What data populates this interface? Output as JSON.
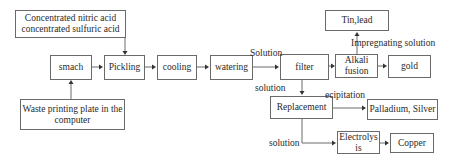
{
  "diagram": {
    "type": "process-flowchart",
    "nodes": {
      "acids": "Concentrated nitric acid\nconcentrated sulfuric acid",
      "acids_line1": "Concentrated nitric acid",
      "acids_line2": "concentrated sulfuric acid",
      "smach": "smach",
      "pickling": "Pickling",
      "cooling": "cooling",
      "watering": "watering",
      "filter": "filter",
      "alkali_line1": "Alkali",
      "alkali_line2": "fusion",
      "gold": "gold",
      "tin_lead": "Tin,lead",
      "waste_line1": "Waste printing plate in the",
      "waste_line2": "computer",
      "replacement": "Replacement",
      "pd_ag": "Palladium, Silver",
      "electro_line1": "Electrolys",
      "electro_line2": "is",
      "copper": "Copper"
    },
    "edge_labels": {
      "solution_top": "Solution",
      "solution_mid": "solution",
      "impregnating": "Impregnating solution",
      "precipitation": "ecipitation",
      "solution_bottom": "solution"
    },
    "edges": [
      {
        "from": "waste",
        "to": "smach"
      },
      {
        "from": "acids",
        "to": "pickling"
      },
      {
        "from": "smach",
        "to": "pickling"
      },
      {
        "from": "pickling",
        "to": "cooling"
      },
      {
        "from": "cooling",
        "to": "watering"
      },
      {
        "from": "watering",
        "to": "filter",
        "label": "Solution"
      },
      {
        "from": "filter",
        "to": "alkali_fusion"
      },
      {
        "from": "alkali_fusion",
        "to": "gold"
      },
      {
        "from": "alkali_fusion",
        "to": "tin_lead",
        "label": "Impregnating solution"
      },
      {
        "from": "filter",
        "to": "replacement",
        "label": "solution"
      },
      {
        "from": "replacement",
        "to": "pd_ag",
        "label": "ecipitation"
      },
      {
        "from": "replacement",
        "to": "electrolysis",
        "label": "solution"
      },
      {
        "from": "electrolysis",
        "to": "copper"
      }
    ]
  }
}
